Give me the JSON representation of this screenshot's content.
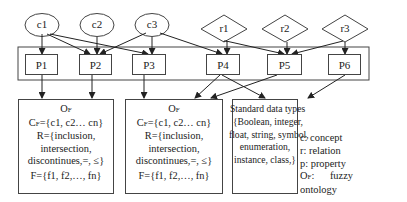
{
  "concepts": [
    {
      "id": "c1",
      "label": "c1"
    },
    {
      "id": "c2",
      "label": "c2"
    },
    {
      "id": "c3",
      "label": "c3"
    }
  ],
  "relations": [
    {
      "id": "r1",
      "label": "r1"
    },
    {
      "id": "r2",
      "label": "r2"
    },
    {
      "id": "r3",
      "label": "r3"
    }
  ],
  "properties": [
    {
      "id": "P1",
      "label": "P1"
    },
    {
      "id": "P2",
      "label": "P2"
    },
    {
      "id": "P3",
      "label": "P3"
    },
    {
      "id": "P4",
      "label": "P4"
    },
    {
      "id": "P5",
      "label": "P5"
    },
    {
      "id": "P6",
      "label": "P6"
    }
  ],
  "ontology_box_1": {
    "title": "O",
    "title_sub": "F",
    "concepts_line": "C",
    "concepts_sub": "F",
    "concepts_value": "={c1, c2… cn}",
    "relations_line1": "R={inclusion,",
    "relations_line2": "intersection,",
    "relations_line3": "discontinues,=,  ≤}",
    "functions_line": "F={f1, f2,…, fn}"
  },
  "ontology_box_2": {
    "title": "O",
    "title_sub": "F",
    "concepts_line": "C",
    "concepts_sub": "F",
    "concepts_value": "={c1, c2… cn}",
    "relations_line1": "R={inclusion,",
    "relations_line2": "intersection,",
    "relations_line3": "discontinues,=,  ≤}",
    "functions_line": "F={f1, f2,…, fn}"
  },
  "datatypes_box": {
    "line1": "Standard data types",
    "line2": "{Boolean, integer,",
    "line3": "float, string, symbol,",
    "line4": "enumeration,",
    "line5": "instance, class,}"
  },
  "legend": {
    "concept": "c: concept",
    "relation": "r: relation",
    "property": "p: property",
    "ontology_prefix": "O",
    "ontology_sub": "F",
    "ontology_text": ":      fuzzy",
    "ontology_text2": "ontology"
  }
}
